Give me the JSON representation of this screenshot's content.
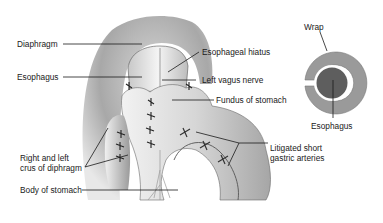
{
  "diagram": {
    "labels": {
      "diaphragm": "Diaphragm",
      "esophagus_left": "Esophagus",
      "esophageal_hiatus": "Esophageal hiatus",
      "left_vagus_nerve": "Left vagus nerve",
      "fundus_of_stomach": "Fundus of stomach",
      "crus_line1": "Right and left",
      "crus_line2": "crus of diphragm",
      "litigated_line1": "Litigated short",
      "litigated_line2": "gastric arteries",
      "body_of_stomach": "Body of stomach"
    },
    "inset": {
      "wrap": "Wrap",
      "esophagus": "Esophagus",
      "colors": {
        "wrap_ring": "#9a9a9a",
        "inner_gap": "#ffffff",
        "esophagus_core": "#5e5e5e"
      }
    },
    "colors": {
      "background": "#ffffff",
      "leader_line": "#1a1a1a",
      "tissue_light": "#e6e6e6",
      "tissue_mid": "#b4b4b4",
      "tissue_dark": "#7a7a7a"
    }
  }
}
